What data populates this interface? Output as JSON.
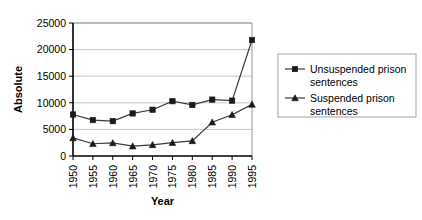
{
  "chart_data": {
    "type": "line",
    "title": "",
    "xlabel": "Year",
    "ylabel": "Absolute",
    "categories": [
      1950,
      1955,
      1960,
      1965,
      1970,
      1975,
      1980,
      1985,
      1990,
      1995
    ],
    "xtick_labels": [
      "1950",
      "1955",
      "1960",
      "1965",
      "1970",
      "1975",
      "1980",
      "1985",
      "1990",
      "1995"
    ],
    "ytick_labels": [
      "0",
      "5000",
      "10000",
      "15000",
      "20000",
      "25000"
    ],
    "yticks": [
      0,
      5000,
      10000,
      15000,
      20000,
      25000
    ],
    "ylim": [
      0,
      25000
    ],
    "xlim": [
      1950,
      1995
    ],
    "grid": true,
    "grid_axis": "y",
    "legend_position": "right",
    "series": [
      {
        "name": "Unsuspended prison sentences",
        "marker": "square",
        "color": "#3a3a3a",
        "values": [
          7800,
          6750,
          6550,
          8000,
          8700,
          10300,
          9600,
          10600,
          10400,
          21800
        ]
      },
      {
        "name": "Suspended prison sentences",
        "marker": "triangle",
        "color": "#3a3a3a",
        "values": [
          3400,
          2300,
          2450,
          1850,
          2100,
          2500,
          2850,
          6350,
          7750,
          9700
        ]
      }
    ]
  },
  "legend": {
    "entries": [
      {
        "label_line1": "Unsuspended prison",
        "label_line2": "sentences"
      },
      {
        "label_line1": "Suspended prison",
        "label_line2": "sentences"
      }
    ]
  },
  "colors": {
    "gridline": "#b9b9b9",
    "axis": "#000000",
    "series": "#3a3a3a",
    "background": "#ffffff"
  }
}
